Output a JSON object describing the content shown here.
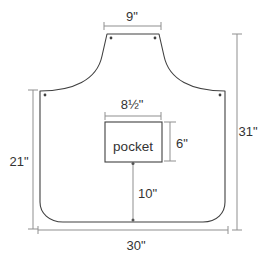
{
  "diagram": {
    "kind": "apron-pattern-diagram",
    "labels": {
      "neck_width": "9\"",
      "pocket_width": "8½\"",
      "pocket_height": "6\"",
      "side_height": "21\"",
      "total_height": "31\"",
      "pocket_to_hem": "10\"",
      "hem_width": "30\"",
      "pocket_name": "pocket"
    },
    "colors": {
      "background": "#ffffff",
      "outline": "#404040",
      "dimension_line": "#8f8f8f",
      "text": "#333333",
      "dot": "#404040"
    }
  }
}
